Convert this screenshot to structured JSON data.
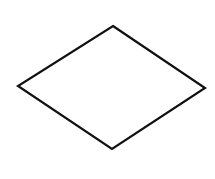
{
  "diagram": {
    "background": "#ffffff",
    "shapes": [
      {
        "type": "diamond",
        "name": "decision-diamond",
        "stroke": "#111111",
        "stroke_width": 2.2,
        "fill": "#ffffff",
        "label": "",
        "points": {
          "top": [
            113,
            26
          ],
          "right": [
            205,
            88
          ],
          "bottom": [
            112,
            149
          ],
          "left": [
            18,
            86
          ]
        }
      }
    ]
  }
}
